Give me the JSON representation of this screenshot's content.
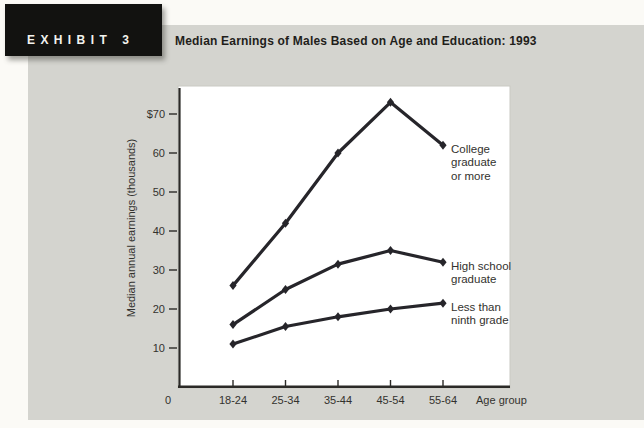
{
  "header": {
    "exhibit_label": "EXHIBIT",
    "exhibit_number": "3",
    "title": "Median Earnings of Males Based on Age and Education: 1993"
  },
  "chart_data": {
    "type": "line",
    "title": "Median Earnings of Males Based on Age and Education: 1993",
    "categories": [
      "18-24",
      "25-34",
      "35-44",
      "45-54",
      "55-64"
    ],
    "series": [
      {
        "name": "College graduate or more",
        "label_lines": [
          "College",
          "graduate",
          "or more"
        ],
        "values": [
          26,
          42,
          60,
          73,
          62
        ]
      },
      {
        "name": "High school graduate",
        "label_lines": [
          "High school",
          "graduate"
        ],
        "values": [
          16,
          25,
          31.5,
          35,
          32
        ]
      },
      {
        "name": "Less than ninth grade",
        "label_lines": [
          "Less than",
          "ninth grade"
        ],
        "values": [
          11,
          15.5,
          18,
          20,
          21.5
        ]
      }
    ],
    "xlabel": "Age group",
    "ylabel": "Median annual earnings (thousands)",
    "y_ticks": [
      "$70",
      "60",
      "50",
      "40",
      "30",
      "20",
      "10"
    ],
    "y_tick_values": [
      70,
      60,
      50,
      40,
      30,
      20,
      10
    ],
    "origin_label": "0",
    "ylim": [
      0,
      77
    ],
    "grid": false,
    "legend_position": "right-of-last-point",
    "line_color": "#26252a",
    "axis_color": "#2b2a27",
    "plot_background": "#ffffff",
    "panel_background": "#d4d4cf",
    "text_color": "#33322e"
  }
}
